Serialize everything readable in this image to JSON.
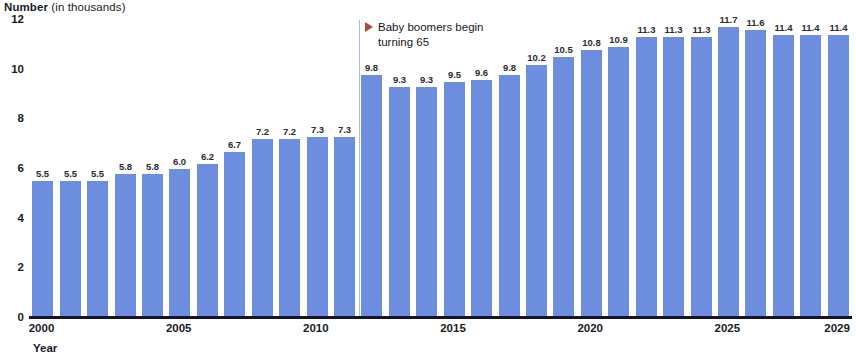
{
  "chart_data": {
    "type": "bar",
    "title": "Number (in thousands)",
    "title_bold_part": "Number",
    "title_light_part": " (in thousands)",
    "xlabel": "Year",
    "ylabel": "Number (in thousands)",
    "ylim": [
      0,
      12
    ],
    "grid": false,
    "legend": "none",
    "categories": [
      "2000",
      "2001",
      "2002",
      "2003",
      "2004",
      "2005",
      "2006",
      "2007",
      "2008",
      "2009",
      "2010",
      "2011",
      "2012",
      "2013",
      "2014",
      "2015",
      "2016",
      "2017",
      "2018",
      "2019",
      "2020",
      "2021",
      "2022",
      "2023",
      "2024",
      "2025",
      "2026",
      "2027",
      "2028",
      "2029"
    ],
    "values": [
      5.5,
      5.5,
      5.5,
      5.8,
      5.8,
      6.0,
      6.2,
      6.7,
      7.2,
      7.2,
      7.3,
      7.3,
      9.8,
      9.3,
      9.3,
      9.5,
      9.6,
      9.8,
      10.2,
      10.5,
      10.8,
      10.9,
      11.3,
      11.3,
      11.3,
      11.7,
      11.6,
      11.4,
      11.4,
      11.4
    ],
    "value_labels": [
      "5.5",
      "5.5",
      "5.5",
      "5.8",
      "5.8",
      "6.0",
      "6.2",
      "6.7",
      "7.2",
      "7.2",
      "7.3",
      "7.3",
      "9.8",
      "9.3",
      "9.3",
      "9.5",
      "9.6",
      "9.8",
      "10.2",
      "10.5",
      "10.8",
      "10.9",
      "11.3",
      "11.3",
      "11.3",
      "11.7",
      "11.6",
      "11.4",
      "11.4",
      "11.4"
    ],
    "y_ticks": [
      "0",
      "2",
      "4",
      "6",
      "8",
      "10",
      "12"
    ],
    "y_tick_values": [
      0,
      2,
      4,
      6,
      8,
      10,
      12
    ],
    "x_ticks": [
      "2000",
      "2005",
      "2010",
      "2015",
      "2020",
      "2025",
      "2029"
    ],
    "x_tick_indices": [
      0,
      5,
      10,
      15,
      20,
      25,
      29
    ],
    "bar_color": "#6d8ede",
    "annotations": [
      {
        "name": "baby-boomers",
        "line1": "Baby boomers begin",
        "line2": "turning 65",
        "marker_color": "#b0483c",
        "divider_after_index": 11,
        "divider_color": "#a9bcd8"
      }
    ]
  }
}
